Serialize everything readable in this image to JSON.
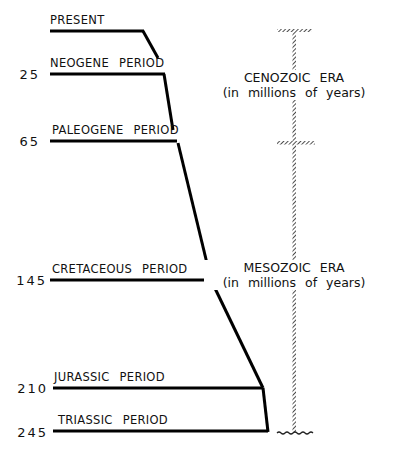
{
  "periods": [
    {
      "label": "PRESENT",
      "age": ""
    },
    {
      "label": "NEOGENE PERIOD",
      "age": "25"
    },
    {
      "label": "PALEOGENE PERIOD",
      "age": "65"
    },
    {
      "label": "CRETACEOUS PERIOD",
      "age": "145"
    },
    {
      "label": "JURASSIC PERIOD",
      "age": "210"
    },
    {
      "label": "TRIASSIC PERIOD",
      "age": "245"
    }
  ],
  "eras": [
    {
      "name": "CENOZOIC ERA",
      "unit": "(in millions of years)"
    },
    {
      "name": "MESOZOIC ERA",
      "unit": "(in millions of years)"
    }
  ]
}
